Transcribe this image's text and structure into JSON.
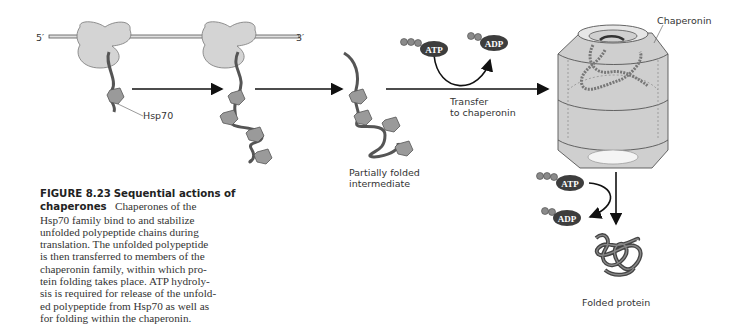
{
  "figure": {
    "number": "FIGURE 8.23",
    "title": "Sequential actions of chaperones",
    "caption_lines": [
      "Chaperones of the",
      "Hsp70 family bind to and stabilize",
      "unfolded polypeptide chains during",
      "translation. The unfolded polypeptide",
      "is then transferred to members of the",
      "chaperonin family, within which pro-",
      "tein folding takes place. ATP hydroly-",
      "sis is required for release of the unfold-",
      "ed polypeptide from Hsp70 as well as",
      "for folding within the chaperonin."
    ]
  },
  "labels": {
    "mrna_5": "5′",
    "mrna_3": "3′",
    "hsp70": "Hsp70",
    "intermediate_line1": "Partially folded",
    "intermediate_line2": "intermediate",
    "transfer_line1": "Transfer",
    "transfer_line2": "to chaperonin",
    "chaperonin": "Chaperonin",
    "folded_protein": "Folded protein",
    "atp": "ATP",
    "adp": "ADP"
  },
  "colors": {
    "ribosome": "#d4d4d4",
    "chain": "#555555",
    "hsp70": "#9a9a9a",
    "chaperonin_fill": "#cfcfcf",
    "molecule": "#3d3d3d",
    "phosphate": "#8a8a8a"
  }
}
